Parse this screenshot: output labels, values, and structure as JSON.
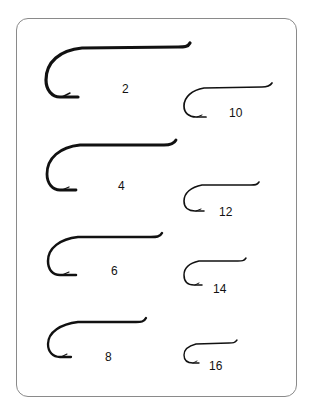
{
  "colors": {
    "ink": "#111111",
    "frame": "#8a8a8a",
    "background": "#ffffff"
  },
  "hooks": [
    {
      "size": "2",
      "column": "left",
      "label": "2"
    },
    {
      "size": "4",
      "column": "left",
      "label": "4"
    },
    {
      "size": "6",
      "column": "left",
      "label": "6"
    },
    {
      "size": "8",
      "column": "left",
      "label": "8"
    },
    {
      "size": "10",
      "column": "right",
      "label": "10"
    },
    {
      "size": "12",
      "column": "right",
      "label": "12"
    },
    {
      "size": "14",
      "column": "right",
      "label": "14"
    },
    {
      "size": "16",
      "column": "right",
      "label": "16"
    }
  ]
}
